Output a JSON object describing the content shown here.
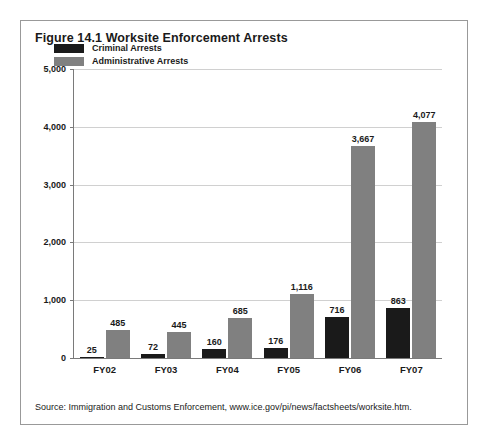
{
  "figure": {
    "title": "Figure 14.1 Worksite Enforcement Arrests",
    "source": "Source: Immigration and Customs Enforcement, www.ice.gov/pi/news/factsheets/worksite.htm.",
    "cut_off_header": "",
    "colors": {
      "criminal": "#1a1a1a",
      "administrative": "#808080",
      "gridline": "#d0d0d0",
      "axis": "#7a7a7a",
      "frame_border": "#999999",
      "background": "#ffffff",
      "text": "#1a1a1a"
    }
  },
  "chart_data": {
    "type": "bar",
    "title": "Figure 14.1 Worksite Enforcement Arrests",
    "xlabel": "",
    "ylabel": "",
    "ylim": [
      0,
      5000
    ],
    "grid": true,
    "legend_position": "top-left",
    "categories": [
      "FY02",
      "FY03",
      "FY04",
      "FY05",
      "FY06",
      "FY07"
    ],
    "ytick_labels": [
      "0",
      "1,000",
      "2,000",
      "3,000",
      "4,000",
      "5,000"
    ],
    "ytick_values": [
      0,
      1000,
      2000,
      3000,
      4000,
      5000
    ],
    "series": [
      {
        "name": "Criminal Arrests",
        "color": "#1a1a1a",
        "values": [
          25,
          72,
          160,
          176,
          716,
          863
        ],
        "value_labels": [
          "25",
          "72",
          "160",
          "176",
          "716",
          "863"
        ]
      },
      {
        "name": "Administrative Arrests",
        "color": "#808080",
        "values": [
          485,
          445,
          685,
          1116,
          3667,
          4077
        ],
        "value_labels": [
          "485",
          "445",
          "685",
          "1,116",
          "3,667",
          "4,077"
        ]
      }
    ]
  }
}
